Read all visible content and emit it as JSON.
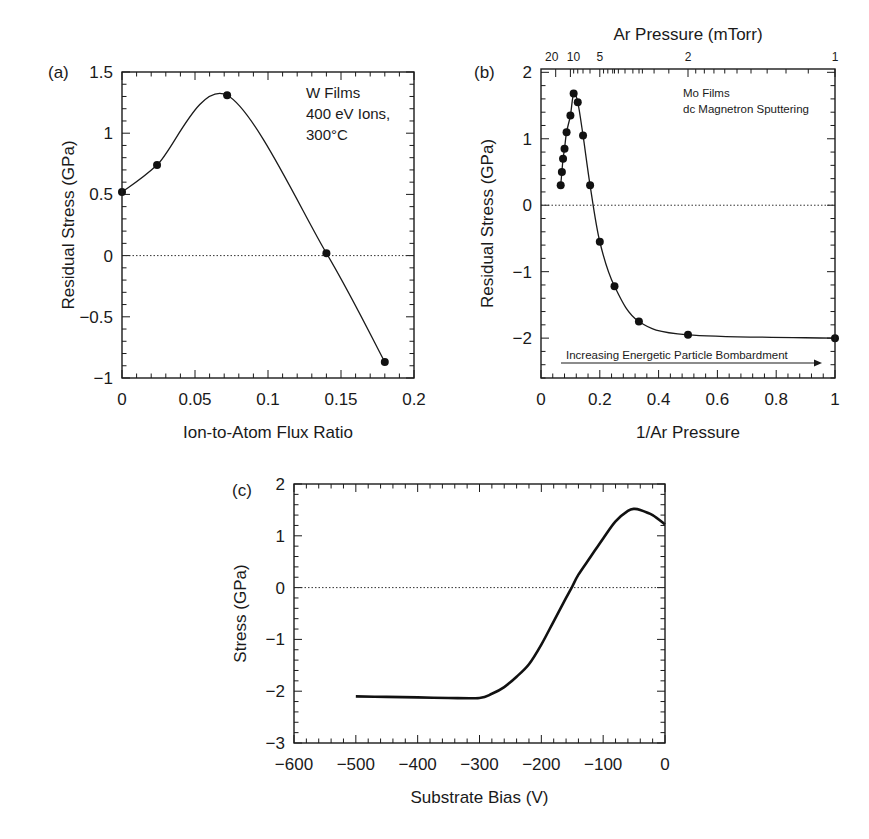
{
  "chart_data": [
    {
      "id": "a",
      "panel_label": "(a)",
      "type": "line",
      "xlabel": "Ion-to-Atom Flux Ratio",
      "ylabel": "Residual Stress (GPa)",
      "xlim": [
        0,
        0.2
      ],
      "ylim": [
        -1,
        1.5
      ],
      "xticks": [
        0,
        0.05,
        0.1,
        0.15,
        0.2
      ],
      "xtick_labels": [
        "0",
        "0.05",
        "0.1",
        "0.15",
        "0.2"
      ],
      "yticks": [
        -1,
        -0.5,
        0,
        0.5,
        1,
        1.5
      ],
      "ytick_labels": [
        "−1",
        "−0.5",
        "0",
        "0.5",
        "1",
        "1.5"
      ],
      "x_minor_step": 0.01,
      "y_minor_step": 0.1,
      "zero_line": true,
      "annotation": [
        "W Films",
        "400 eV Ions,",
        "300°C"
      ],
      "series": [
        {
          "name": "W Films",
          "markers": true,
          "x": [
            0,
            0.024,
            0.072,
            0.14,
            0.18
          ],
          "y": [
            0.52,
            0.74,
            1.31,
            0.02,
            -0.87
          ]
        }
      ]
    },
    {
      "id": "b",
      "panel_label": "(b)",
      "type": "line",
      "title": "Ar Pressure (mTorr)",
      "xlabel": "1/Ar Pressure",
      "ylabel": "Residual Stress (GPa)",
      "xlim": [
        0,
        1
      ],
      "ylim": [
        -2.6,
        2.05
      ],
      "xticks": [
        0,
        0.2,
        0.4,
        0.6,
        0.8,
        1
      ],
      "xtick_labels": [
        "0",
        "0.2",
        "0.4",
        "0.6",
        "0.8",
        "1"
      ],
      "yticks": [
        -2,
        -1,
        0,
        1,
        2
      ],
      "ytick_labels": [
        "−2",
        "−1",
        "0",
        "1",
        "2"
      ],
      "x_minor_step": 0.04,
      "y_minor_step": 0.2,
      "top_axis": {
        "label": "Ar Pressure (mTorr)",
        "ticks_pressure": [
          20,
          10,
          5,
          2,
          1
        ],
        "tick_labels": [
          "20",
          "10",
          "5",
          "2",
          "1"
        ]
      },
      "zero_line": true,
      "annotation": [
        "Mo Films",
        "dc Magnetron Sputtering"
      ],
      "arrow_label": "Increasing Energetic Particle Bombardment",
      "series": [
        {
          "name": "Mo Films",
          "markers": true,
          "x": [
            0.067,
            0.071,
            0.075,
            0.08,
            0.087,
            0.1,
            0.111,
            0.125,
            0.143,
            0.167,
            0.2,
            0.25,
            0.333,
            0.5,
            1.0
          ],
          "y": [
            0.3,
            0.5,
            0.7,
            0.85,
            1.1,
            1.35,
            1.68,
            1.55,
            1.05,
            0.3,
            -0.55,
            -1.22,
            -1.75,
            -1.95,
            -2.0
          ]
        }
      ]
    },
    {
      "id": "c",
      "panel_label": "(c)",
      "type": "line",
      "xlabel": "Substrate Bias (V)",
      "ylabel": "Stress (GPa)",
      "xlim": [
        -600,
        0
      ],
      "ylim": [
        -3,
        2
      ],
      "xticks": [
        -600,
        -500,
        -400,
        -300,
        -200,
        -100,
        0
      ],
      "xtick_labels": [
        "−600",
        "−500",
        "−400",
        "−300",
        "−200",
        "−100",
        "0"
      ],
      "yticks": [
        -3,
        -2,
        -1,
        0,
        1,
        2
      ],
      "ytick_labels": [
        "−3",
        "−2",
        "−1",
        "0",
        "1",
        "2"
      ],
      "x_minor_step": 20,
      "y_minor_step": 0.2,
      "zero_line": true,
      "series": [
        {
          "name": "Stress",
          "markers": false,
          "x": [
            -500,
            -450,
            -400,
            -350,
            -300,
            -280,
            -260,
            -240,
            -220,
            -200,
            -180,
            -160,
            -150,
            -140,
            -120,
            -100,
            -80,
            -60,
            -50,
            -40,
            -20,
            0
          ],
          "y": [
            -2.1,
            -2.11,
            -2.12,
            -2.13,
            -2.13,
            -2.05,
            -1.92,
            -1.72,
            -1.48,
            -1.1,
            -0.65,
            -0.2,
            0.02,
            0.25,
            0.6,
            0.95,
            1.28,
            1.48,
            1.52,
            1.5,
            1.4,
            1.22
          ]
        }
      ]
    }
  ],
  "caption": "Figure caption text partially visible at the bottom edge (cut off)"
}
